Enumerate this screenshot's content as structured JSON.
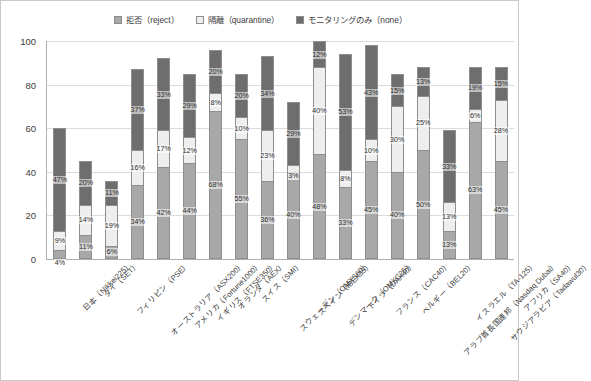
{
  "chart_data": {
    "type": "bar",
    "subtype": "stacked-bar-100",
    "title": "",
    "xlabel": "",
    "ylabel": "",
    "ylim": [
      0,
      100
    ],
    "yticks": [
      "0",
      "20",
      "40",
      "60",
      "80",
      "100"
    ],
    "grid": true,
    "legend_position": "top-center",
    "categories": [
      "日本（Nikkei225）",
      "タイ（SET）",
      "フィリピン（PSE）",
      "オーストラリア（ASX200）",
      "アメリカ（Fortune1000）",
      "イギリス（FTSE350）",
      "オランダ（AEX）",
      "スイス（SMI）",
      "スウェーデン（OMXS60）",
      "スペイン（IBEX35）",
      "デンマーク（OMXC25）",
      "ドイツ（DAX40）",
      "フランス（CAC40）",
      "ベルギー（BEL20）",
      "アラブ首長国連邦（Nasdaq Dubai）",
      "イスラエル（TA-125）",
      "サウジアラビア（Tadawul30）",
      "アフリカ（SA40）"
    ],
    "series": [
      {
        "name": "拒否（reject）",
        "key": "reject",
        "color": "#a8a8a8",
        "values": [
          4,
          11,
          6,
          34,
          42,
          44,
          68,
          55,
          36,
          40,
          48,
          33,
          45,
          40,
          50,
          13,
          63,
          45
        ],
        "labels": [
          "4%",
          "11%",
          "6%",
          "34%",
          "42%",
          "44%",
          "68%",
          "55%",
          "36%",
          "40%",
          "48%",
          "33%",
          "45%",
          "40%",
          "50%",
          "13%",
          "63%",
          "45%"
        ]
      },
      {
        "name": "隔離（quarantine）",
        "key": "quarantine",
        "color": "#eeeeee",
        "values": [
          9,
          14,
          19,
          16,
          17,
          12,
          8,
          10,
          23,
          3,
          40,
          8,
          10,
          30,
          25,
          13,
          6,
          28
        ],
        "labels": [
          "9%",
          "14%",
          "19%",
          "16%",
          "17%",
          "12%",
          "8%",
          "10%",
          "23%",
          "3%",
          "40%",
          "8%",
          "10%",
          "30%",
          "25%",
          "13%",
          "6%",
          "28%"
        ]
      },
      {
        "name": "モニタリングのみ（none）",
        "key": "none",
        "color": "#6e6e6e",
        "values": [
          47,
          20,
          11,
          37,
          33,
          29,
          20,
          20,
          34,
          29,
          12,
          53,
          43,
          15,
          13,
          33,
          19,
          15
        ],
        "labels": [
          "47%",
          "20%",
          "11%",
          "37%",
          "33%",
          "29%",
          "20%",
          "20%",
          "34%",
          "29%",
          "12%",
          "53%",
          "43%",
          "15%",
          "13%",
          "33%",
          "19%",
          "15%"
        ]
      }
    ]
  },
  "legend": {
    "items": [
      {
        "label": "拒否（reject）",
        "swatch": "#a8a8a8"
      },
      {
        "label": "隔離（quarantine）",
        "swatch": "#eeeeee"
      },
      {
        "label": "モニタリングのみ（none）",
        "swatch": "#6e6e6e"
      }
    ]
  },
  "footnote": ""
}
